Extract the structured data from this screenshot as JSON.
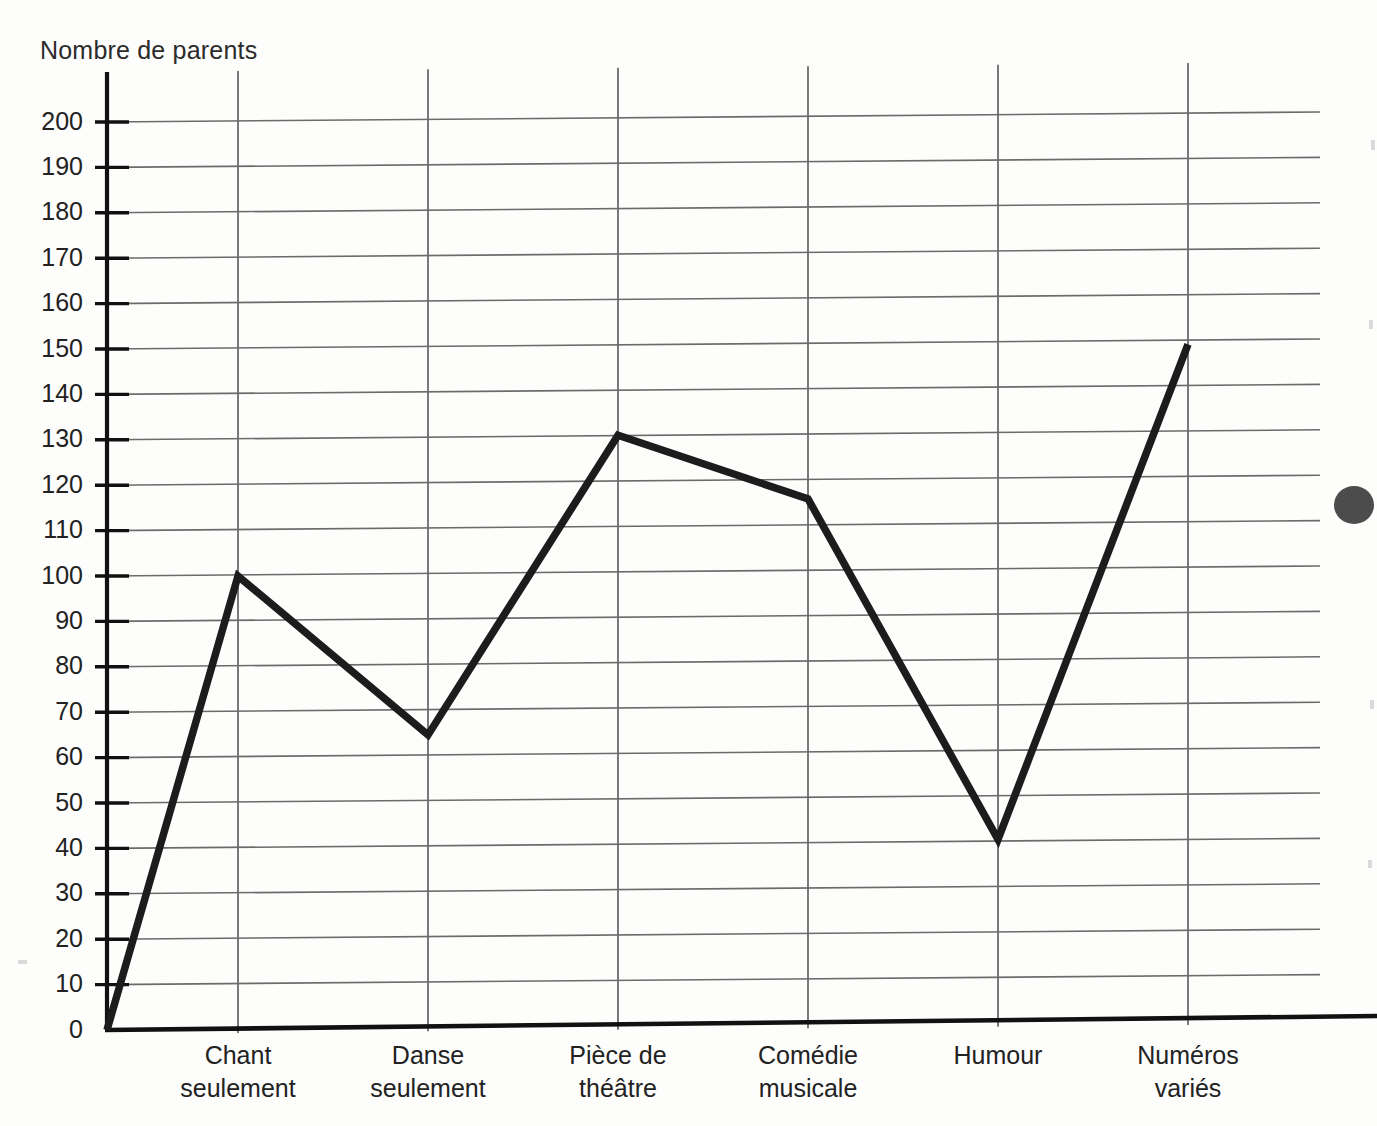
{
  "chart_data": {
    "type": "line",
    "title": "",
    "ylabel": "Nombre de parents",
    "xlabel": "",
    "categories": [
      "Chant seulement",
      "Danse seulement",
      "Pièce de théâtre",
      "Comédie musicale",
      "Humour",
      "Numéros variés"
    ],
    "category_lines": [
      [
        "Chant",
        "seulement"
      ],
      [
        "Danse",
        "seulement"
      ],
      [
        "Pièce de",
        "théâtre"
      ],
      [
        "Comédie",
        "musicale"
      ],
      [
        "Humour",
        ""
      ],
      [
        "Numéros",
        "variés"
      ]
    ],
    "values": [
      100,
      65,
      131,
      117,
      42,
      151
    ],
    "origin_value": 0,
    "ylim": [
      0,
      200
    ],
    "ytick_step": 10,
    "ytick_labels": [
      "200",
      "190",
      "180",
      "170",
      "160",
      "150",
      "140",
      "130",
      "120",
      "110",
      "100",
      "90",
      "80",
      "70",
      "60",
      "50",
      "40",
      "30",
      "20",
      "10",
      "0"
    ],
    "grid": true,
    "legend": "none",
    "series_name": "Nombre de parents",
    "line_color": "#1c1c1c",
    "grid_color": "#6b6b6b",
    "axis_color": "#111111"
  },
  "annotations": {
    "scan_artifact": "dark-blob-right-edge"
  }
}
